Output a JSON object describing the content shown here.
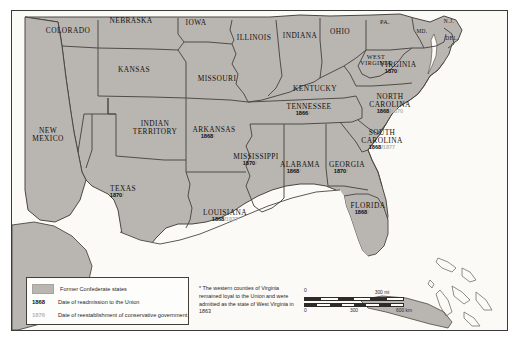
{
  "map": {
    "title": "Reconstruction of the Southern United States",
    "background_color": "#f7f6f2",
    "confederate_fill": "#b9b6b1",
    "union_fill": "#b9b6b1",
    "water_color": "#fbfaf7",
    "border_color": "#3a3a3a"
  },
  "states": [
    {
      "name": "COLORADO",
      "x": 68,
      "y": 31,
      "size": "normal",
      "d1": "",
      "d2": ""
    },
    {
      "name": "NEBRASKA",
      "x": 131,
      "y": 21,
      "size": "normal",
      "d1": "",
      "d2": ""
    },
    {
      "name": "IOWA",
      "x": 196,
      "y": 23,
      "size": "normal",
      "d1": "",
      "d2": ""
    },
    {
      "name": "ILLINOIS",
      "x": 254,
      "y": 38,
      "size": "normal",
      "d1": "",
      "d2": ""
    },
    {
      "name": "INDIANA",
      "x": 300,
      "y": 36,
      "size": "normal",
      "d1": "",
      "d2": ""
    },
    {
      "name": "OHIO",
      "x": 340,
      "y": 32,
      "size": "normal",
      "d1": "",
      "d2": ""
    },
    {
      "name": "PA.",
      "x": 385,
      "y": 22,
      "size": "sm",
      "d1": "",
      "d2": ""
    },
    {
      "name": "N.J.",
      "x": 449,
      "y": 22,
      "size": "xs",
      "d1": "",
      "d2": ""
    },
    {
      "name": "MD.",
      "x": 422,
      "y": 32,
      "size": "xs",
      "d1": "",
      "d2": ""
    },
    {
      "name": "DEL.",
      "x": 452,
      "y": 39,
      "size": "xs",
      "d1": "",
      "d2": ""
    },
    {
      "name": "KANSAS",
      "x": 134,
      "y": 70,
      "size": "normal",
      "d1": "",
      "d2": ""
    },
    {
      "name": "MISSOURI",
      "x": 217,
      "y": 79,
      "size": "normal",
      "d1": "",
      "d2": ""
    },
    {
      "name": "KENTUCKY",
      "x": 315,
      "y": 89,
      "size": "normal",
      "d1": "",
      "d2": ""
    },
    {
      "name": "WEST\nVIRGINIA",
      "x": 376,
      "y": 60,
      "size": "sm",
      "d1": "",
      "d2": ""
    },
    {
      "name": "NEW\nMEXICO",
      "x": 48,
      "y": 135,
      "size": "normal",
      "d1": "",
      "d2": ""
    },
    {
      "name": "INDIAN\nTERRITORY",
      "x": 155,
      "y": 128,
      "size": "normal",
      "d1": "",
      "d2": ""
    },
    {
      "name": "VIRGINIA",
      "x": 398,
      "y": 68,
      "size": "normal",
      "d1": "1870",
      "d2": "1869"
    },
    {
      "name": "TENNESSEE",
      "x": 309,
      "y": 110,
      "size": "normal",
      "d1": "1866",
      "d2": "1869"
    },
    {
      "name": "NORTH\nCAROLINA",
      "x": 390,
      "y": 104,
      "size": "normal",
      "d1": "1868",
      "d2": "1870"
    },
    {
      "name": "ARKANSAS",
      "x": 214,
      "y": 133,
      "size": "normal",
      "d1": "1868",
      "d2": "1874"
    },
    {
      "name": "SOUTH\nCAROLINA",
      "x": 382,
      "y": 140,
      "size": "normal",
      "d1": "1868",
      "d2": "1877"
    },
    {
      "name": "MISSISSIPPI",
      "x": 256,
      "y": 160,
      "size": "normal",
      "d1": "1870",
      "d2": "1876"
    },
    {
      "name": "ALABAMA",
      "x": 300,
      "y": 168,
      "size": "normal",
      "d1": "1868",
      "d2": "1874"
    },
    {
      "name": "GEORGIA",
      "x": 347,
      "y": 168,
      "size": "normal",
      "d1": "1870",
      "d2": "1872"
    },
    {
      "name": "TEXAS",
      "x": 123,
      "y": 192,
      "size": "normal",
      "d1": "1870",
      "d2": "1873"
    },
    {
      "name": "LOUISIANA",
      "x": 225,
      "y": 216,
      "size": "normal",
      "d1": "1868",
      "d2": "1877"
    },
    {
      "name": "FLORIDA",
      "x": 368,
      "y": 209,
      "size": "normal",
      "d1": "1868",
      "d2": "1877"
    }
  ],
  "legend": {
    "swatch_label": "Former Confederate states",
    "readmission_date": "1868",
    "readmission_label": "Date of readmission to the Union",
    "conservative_date": "1876",
    "conservative_label": "Date of reestablishment of conservative government"
  },
  "footnote": {
    "text": "* The western counties of Virginia remained loyal to the Union and were admitted as the state of West Virginia in 1863"
  },
  "scale": {
    "miles_label": "300 mi",
    "km_zero": "0",
    "km_mid": "300",
    "km_end": "600 km",
    "mi_zero": "0"
  }
}
